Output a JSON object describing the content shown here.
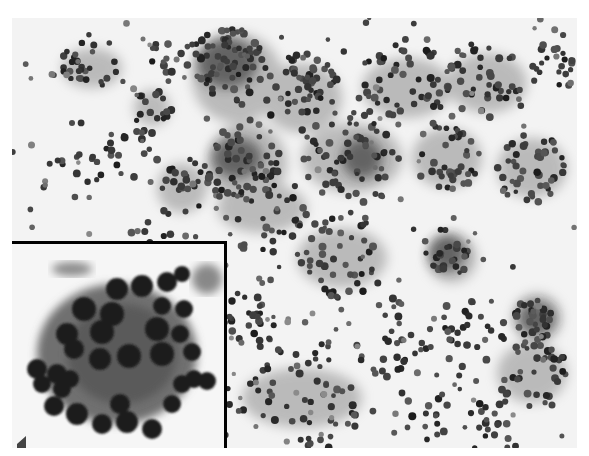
{
  "figure": {
    "type": "cytology-micrograph",
    "stain": "grayscale",
    "caption_clipped": true
  },
  "main_panel": {
    "description": "Low-power cytology smear with clustered and dispersed round nuclei in a fibrillary background",
    "background_color": "#f3f3f3",
    "nucleus_color": "#2a2a2a",
    "cytoplasm_color": "#9a9a9a"
  },
  "inset": {
    "description": "High-power view of a cohesive cell cluster with round dark nuclei around a central stromal core",
    "border_color": "#000000",
    "border_width": 3
  }
}
